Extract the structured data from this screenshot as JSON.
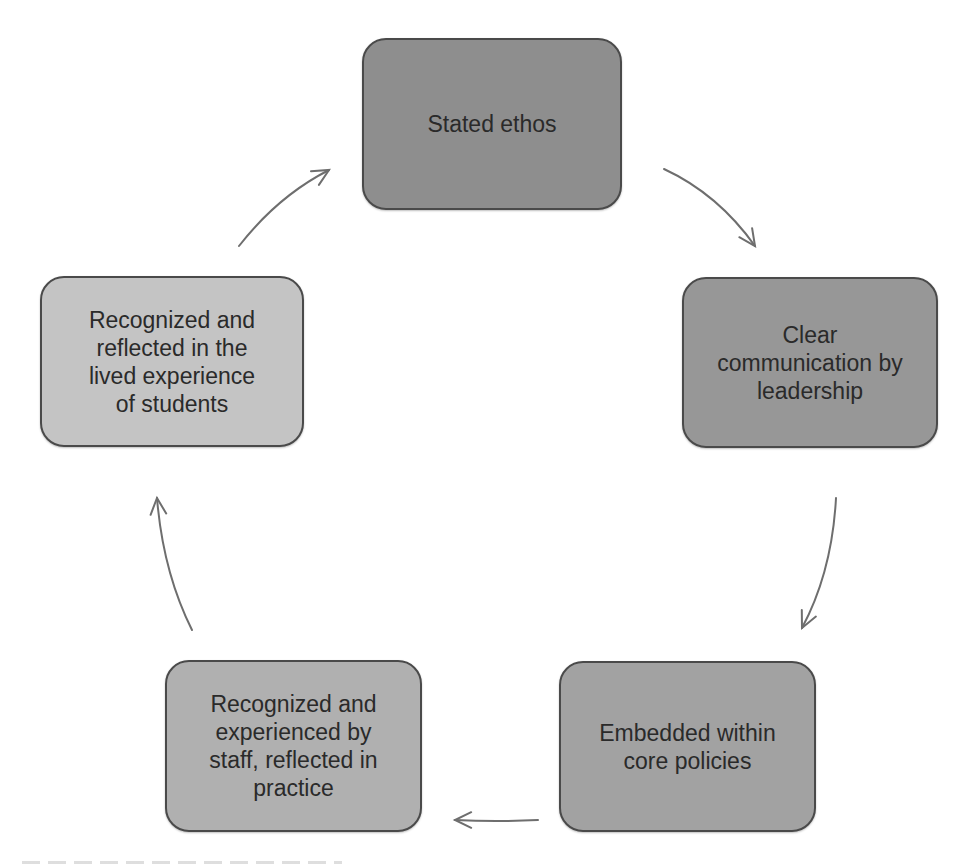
{
  "diagram": {
    "type": "cycle",
    "direction": "clockwise",
    "nodes": [
      {
        "id": "stated-ethos",
        "label": "Stated ethos",
        "fill": "#8e8e8e",
        "box": {
          "x": 362,
          "y": 38,
          "w": 260,
          "h": 172
        }
      },
      {
        "id": "clear-communication",
        "label": "Clear\ncommunication by\nleadership",
        "fill": "#979797",
        "box": {
          "x": 682,
          "y": 277,
          "w": 256,
          "h": 171
        }
      },
      {
        "id": "embedded-policies",
        "label": "Embedded within\ncore policies",
        "fill": "#a2a2a2",
        "box": {
          "x": 559,
          "y": 661,
          "w": 257,
          "h": 171
        }
      },
      {
        "id": "staff-practice",
        "label": "Recognized and\nexperienced by\nstaff, reflected in\npractice",
        "fill": "#b0b0b0",
        "box": {
          "x": 165,
          "y": 660,
          "w": 257,
          "h": 172
        }
      },
      {
        "id": "student-experience",
        "label": "Recognized and\nreflected in the\nlived experience\nof students",
        "fill": "#c4c4c4",
        "box": {
          "x": 40,
          "y": 276,
          "w": 264,
          "h": 171
        }
      }
    ],
    "edges": [
      {
        "from": "stated-ethos",
        "to": "clear-communication",
        "path": "M664,169 Q718,194 755,246",
        "head": [
          755,
          246
        ],
        "angle": 55
      },
      {
        "from": "clear-communication",
        "to": "embedded-policies",
        "path": "M836,498 Q832,572 802,628",
        "head": [
          802,
          628
        ],
        "angle": 115
      },
      {
        "from": "embedded-policies",
        "to": "staff-practice",
        "path": "M538,820 Q496,822 455,820",
        "head": [
          455,
          820
        ],
        "angle": 180
      },
      {
        "from": "staff-practice",
        "to": "student-experience",
        "path": "M192,630 Q163,572 157,498",
        "head": [
          157,
          498
        ],
        "angle": 265
      },
      {
        "from": "student-experience",
        "to": "stated-ethos",
        "path": "M239,246 Q278,196 329,170",
        "head": [
          329,
          170
        ],
        "angle": 330
      }
    ],
    "colors": {
      "border": "#4a4a4a",
      "text": "#2a2a2a",
      "arrow": "#6e6e6e",
      "background": "#ffffff"
    }
  }
}
